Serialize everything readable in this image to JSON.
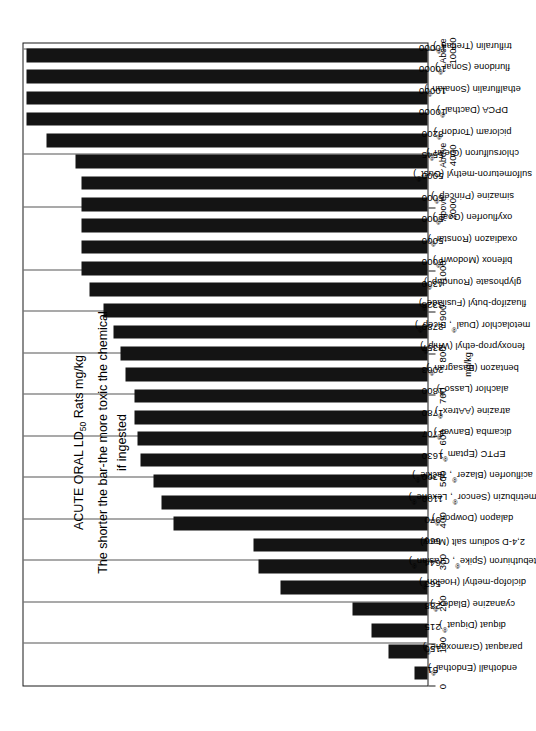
{
  "chart_data": {
    "type": "bar",
    "orientation": "vertical",
    "title": "ACUTE ORAL LD50 Rats mg/kg",
    "title_line1": "ACUTE ORAL LD",
    "title_sub": "50",
    "title_line1b": " Rats mg/kg",
    "title_line2": "The shorter the bar-the more toxic the chemical",
    "title_line3": "if ingested",
    "xlabel": "",
    "ylabel": "mg/kg",
    "axis_unit": "mg/kg",
    "grid": true,
    "legend": "none",
    "ylim": [
      0,
      10000
    ],
    "tick_labels": [
      "0",
      "100",
      "200",
      "300",
      "400",
      "500",
      "600",
      "700",
      "800",
      "900",
      "1000",
      "Above 2000",
      "Above 4000",
      "Above 10000"
    ],
    "tick_values": [
      0,
      100,
      200,
      300,
      400,
      500,
      600,
      700,
      800,
      900,
      1000,
      2000,
      4000,
      10000
    ],
    "categories": [
      "endothall (Endothal®)",
      "paraquat (Gramoxone®)",
      "diquat (Diquat®)",
      "cyanazine (Bladex®)",
      "diclofop-methyl (Hoelon®)",
      "tebuthiuron (Spike®, Graslan®)",
      "2,4-D sodium salt (Many)",
      "dalapon (Dowpon®)",
      "metribuzin (Sencor®, Lexone®)",
      "acifluorfen (Blazer®, Tackle®)",
      "EPTC (Eptam®)",
      "dicamba (Banvel®)",
      "atrazine (AAtrex®)",
      "alachlor (Lasso®)",
      "bentazon (Basagran®)",
      "fenoxyprop-ethyl (Whip®)",
      "metolachlor (Dual®, Bicep®)",
      "fluazifop-butyl (Fusilade®)",
      "glyphosate (Roundup®)",
      "bifenox (Modown®)",
      "oxadiazon (Ronstar®)",
      "oxyfluorfen (Goal®)",
      "simazine (Princep®)",
      "sulfometuron-methyl (Oust®)",
      "chlorsulfuron (Glean®)",
      "picloram (Tordon®)",
      "DPCA (Dacthal®)",
      "ethalfluralin (Sonalan®)",
      "fluridone (Sonar®)",
      "trifluralin (Treflan®)"
    ],
    "values": [
      51,
      150,
      215,
      288,
      563,
      644,
      666,
      970,
      1100,
      1300,
      1630,
      1707,
      1780,
      1800,
      2063,
      2357,
      2780,
      3328,
      4300,
      5000,
      5000,
      5000,
      5000,
      5000,
      5545,
      8200,
      10000,
      10000,
      10000,
      10000
    ],
    "value_labels": [
      "51",
      "150",
      "215",
      "288",
      "563",
      "644",
      "666",
      "970",
      "1100",
      "1300",
      "1630",
      "1707",
      "1780",
      "1800",
      "2063",
      "2357",
      "2780",
      "3328",
      "4300",
      "5000",
      "5000",
      "5000",
      "5000",
      "5000",
      "5545",
      "8200",
      "10000",
      "10000",
      "10000",
      "10000"
    ],
    "bar_color": "#141414",
    "frame_color": "#1a1a1a",
    "grid_color": "#555555",
    "background": "#ffffff"
  }
}
